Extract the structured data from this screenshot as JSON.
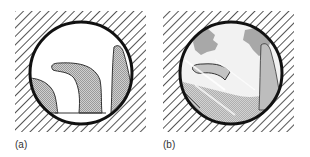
{
  "figure": {
    "panels": [
      {
        "id": "a",
        "label": "(a)",
        "description": "Circular viewport over hatched background showing three grey-stippled shapes on a baseline"
      },
      {
        "id": "b",
        "label": "(b)",
        "description": "Circular viewport over hatched background showing a noisy, textured version of the same scene"
      }
    ],
    "colors": {
      "background": "#ffffff",
      "hatch_line": "#555555",
      "circle_stroke": "#111111",
      "shape_fill": "#b8b8b8",
      "shape_stroke": "#333333",
      "noise_dark": "#9a9a9a",
      "noise_light": "#d6d6d6"
    }
  }
}
